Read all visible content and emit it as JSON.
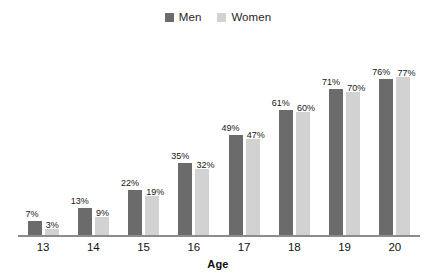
{
  "chart_data": {
    "type": "bar",
    "title": "",
    "subtitle": "",
    "xlabel": "Age",
    "ylabel": "",
    "ylim": [
      0,
      100
    ],
    "grid": false,
    "legend_position": "top-center",
    "categories": [
      "13",
      "14",
      "15",
      "16",
      "17",
      "18",
      "19",
      "20"
    ],
    "series": [
      {
        "name": "Men",
        "color": "#6b6b6b",
        "values": [
          7,
          13,
          22,
          35,
          49,
          61,
          71,
          76
        ],
        "labels": [
          "7%",
          "13%",
          "22%",
          "35%",
          "49%",
          "61%",
          "71%",
          "76%"
        ]
      },
      {
        "name": "Women",
        "color": "#d2d2d2",
        "values": [
          3,
          9,
          19,
          32,
          47,
          60,
          70,
          77
        ],
        "labels": [
          "3%",
          "9%",
          "19%",
          "32%",
          "47%",
          "60%",
          "70%",
          "77%"
        ]
      }
    ]
  },
  "legend": {
    "items": [
      {
        "label": "Men",
        "color": "#6b6b6b"
      },
      {
        "label": "Women",
        "color": "#d2d2d2"
      }
    ]
  },
  "axis": {
    "x_title": "Age",
    "line_color": "#8c8c8c",
    "ticks": [
      "13",
      "14",
      "15",
      "16",
      "17",
      "18",
      "19",
      "20"
    ]
  }
}
